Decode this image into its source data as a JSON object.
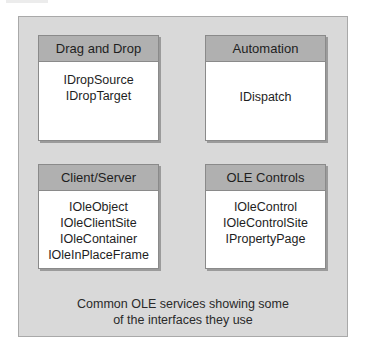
{
  "diagram": {
    "boxes": [
      {
        "title": "Drag and Drop",
        "interfaces": [
          "IDropSource",
          "IDropTarget"
        ]
      },
      {
        "title": "Automation",
        "interfaces": [
          "IDispatch"
        ]
      },
      {
        "title": "Client/Server",
        "interfaces": [
          "IOleObject",
          "IOleClientSite",
          "IOleContainer",
          "IOleInPlaceFrame"
        ]
      },
      {
        "title": "OLE Controls",
        "interfaces": [
          "IOleControl",
          "IOleControlSite",
          "IPropertyPage"
        ]
      }
    ],
    "caption": {
      "line1": "Common OLE services showing some",
      "line2": "of the interfaces they use"
    },
    "colors": {
      "panel_bg": "#d9d9d9",
      "header_bg": "#b0b0b0",
      "box_bg": "#ffffff",
      "border": "#8a8a8a"
    }
  }
}
